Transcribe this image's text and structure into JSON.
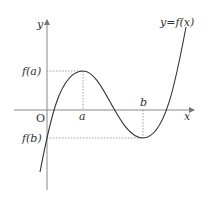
{
  "diagram": {
    "labels": {
      "y_axis": "y",
      "x_axis": "x",
      "origin": "O",
      "a": "a",
      "b": "b",
      "fa": "f(a)",
      "fb": "f(b)",
      "curve": "y=f(x)"
    },
    "colors": {
      "axis": "#777777",
      "curve": "#333333",
      "guide": "#888888",
      "text": "#333333"
    }
  }
}
